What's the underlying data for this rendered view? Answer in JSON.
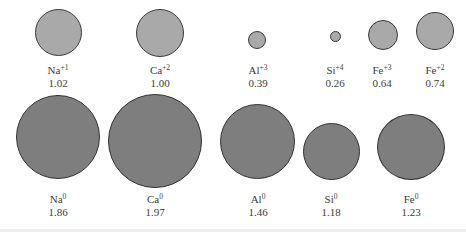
{
  "colors": {
    "ion_fill": "#a9a9a9",
    "atom_fill": "#7e7e7e",
    "outline": "#3a3a3a"
  },
  "ions": [
    {
      "symbol": "Na",
      "charge": "+1",
      "radius": "1.02"
    },
    {
      "symbol": "Ca",
      "charge": "+2",
      "radius": "1.00"
    },
    {
      "symbol": "Al",
      "charge": "+3",
      "radius": "0.39"
    },
    {
      "symbol": "Si",
      "charge": "+4",
      "radius": "0.26"
    },
    {
      "symbol": "Fe",
      "charge": "+3",
      "radius": "0.64"
    },
    {
      "symbol": "Fe",
      "charge": "+2",
      "radius": "0.74"
    }
  ],
  "atoms": [
    {
      "symbol": "Na",
      "charge": "0",
      "radius": "1.86"
    },
    {
      "symbol": "Ca",
      "charge": "0",
      "radius": "1.97"
    },
    {
      "symbol": "Al",
      "charge": "0",
      "radius": "1.46"
    },
    {
      "symbol": "Si",
      "charge": "0",
      "radius": "1.18"
    },
    {
      "symbol": "Fe",
      "charge": "0",
      "radius": "1.23"
    }
  ]
}
